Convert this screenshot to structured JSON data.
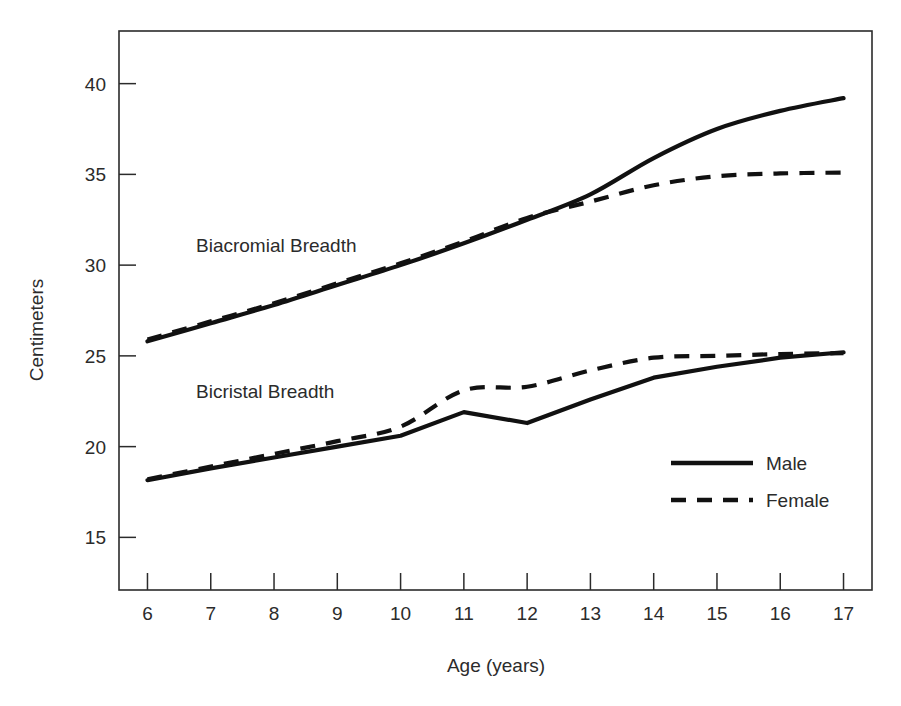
{
  "chart_data": {
    "type": "line",
    "title": "",
    "xlabel": "Age (years)",
    "ylabel": "Centimeters",
    "grid": false,
    "legend_position": "inside-bottom-right",
    "x": [
      6,
      7,
      8,
      9,
      10,
      11,
      12,
      13,
      14,
      15,
      16,
      17
    ],
    "xtick_labels": [
      "6",
      "7",
      "8",
      "9",
      "10",
      "11",
      "12",
      "13",
      "14",
      "15",
      "16",
      "17"
    ],
    "ytick_labels": [
      "15",
      "20",
      "25",
      "30",
      "35",
      "40"
    ],
    "yticks": [
      15,
      20,
      25,
      30,
      35,
      40
    ],
    "xlim": [
      5.55,
      17.45
    ],
    "ylim": [
      12.1,
      42.9
    ],
    "groups": [
      {
        "name": "Biacromial Breadth",
        "annotation": "Biacromial Breadth",
        "series": [
          {
            "name": "Male",
            "style": "solid",
            "values": [
              25.8,
              26.8,
              27.8,
              28.9,
              30.0,
              31.2,
              32.5,
              33.9,
              35.9,
              37.5,
              38.5,
              39.2
            ]
          },
          {
            "name": "Female",
            "style": "dashed",
            "values": [
              25.9,
              26.9,
              27.9,
              29.0,
              30.1,
              31.3,
              32.6,
              33.5,
              34.4,
              34.9,
              35.05,
              35.1
            ]
          }
        ]
      },
      {
        "name": "Bicristal Breadth",
        "annotation": "Bicristal Breadth",
        "series": [
          {
            "name": "Male",
            "style": "solid",
            "values": [
              18.15,
              18.8,
              19.4,
              20.0,
              20.6,
              21.9,
              21.3,
              22.6,
              23.8,
              24.4,
              24.9,
              25.2
            ]
          },
          {
            "name": "Female",
            "style": "dashed",
            "values": [
              18.2,
              18.9,
              19.6,
              20.3,
              21.1,
              23.1,
              23.3,
              24.2,
              24.9,
              25.0,
              25.1,
              25.15
            ]
          }
        ]
      }
    ],
    "legend": [
      {
        "label": "Male",
        "style": "solid"
      },
      {
        "label": "Female",
        "style": "dashed"
      }
    ],
    "colors": {
      "line": "#111111",
      "axis": "#2b2b2b",
      "background": "#ffffff"
    }
  }
}
